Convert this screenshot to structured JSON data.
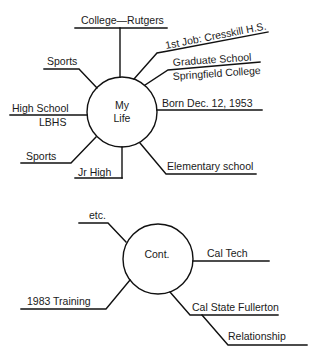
{
  "diagram": {
    "type": "mind-map",
    "stroke_color": "#111111",
    "text_color": "#1a1a1a",
    "map1": {
      "center": {
        "line1": "My",
        "line2": "Life"
      },
      "branches": {
        "college": "College—Rutgers",
        "first_job": "1st Job: Cresskill H.S.",
        "grad_school_1": "Graduate School",
        "grad_school_2": "Springfield College",
        "born": "Born Dec. 12, 1953",
        "elementary": "Elementary school",
        "jr_high": "Jr High",
        "sports_lower": "Sports",
        "high_school_1": "High School",
        "high_school_2": "LBHS",
        "sports_upper": "Sports"
      }
    },
    "map2": {
      "center": {
        "label": "Cont."
      },
      "branches": {
        "etc": "etc.",
        "cal_tech": "Cal Tech",
        "training": "1983 Training",
        "cal_state": "Cal State Fullerton",
        "relationship": "Relationship"
      }
    }
  }
}
